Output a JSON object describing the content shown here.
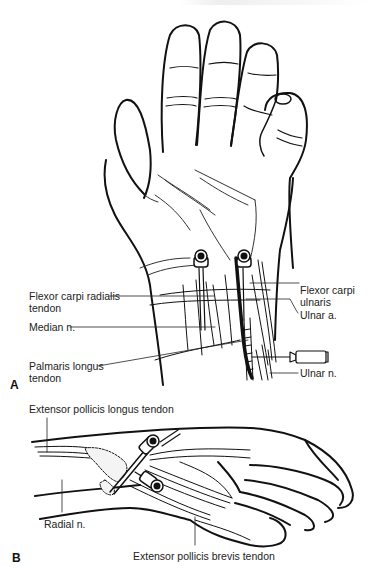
{
  "figure": {
    "panels": [
      {
        "id": "A",
        "label": "A",
        "view": "palmar hand and wrist with needle injections",
        "annotations": {
          "flexor_carpi_radialis": "Flexor carpi radialis tendon",
          "median_nerve": "Median n.",
          "palmaris_longus": "Palmaris longus tendon",
          "flexor_carpi_ulnaris": "Flexor carpi ulnaris",
          "ulnar_artery": "Ulnar a.",
          "ulnar_nerve": "Ulnar n."
        }
      },
      {
        "id": "B",
        "label": "B",
        "view": "radial side of wrist with needle injections",
        "annotations": {
          "epl": "Extensor pollicis longus tendon",
          "radial_nerve": "Radial n.",
          "epb": "Extensor pollicis brevis tendon"
        }
      }
    ]
  }
}
